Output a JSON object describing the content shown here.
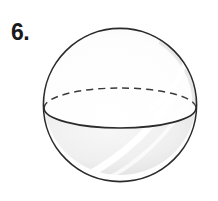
{
  "figure": {
    "label": "6.",
    "shape_name": "sphere",
    "background_color": "#ffffff",
    "outline_color": "#2b2b2b",
    "outline_width": 1.6,
    "equator_front_color": "#2b2b2b",
    "equator_back_color": "#3a3a3a",
    "equator_dash_pattern": "7 5",
    "upper_fill_color": "#fdfdfd",
    "lower_fill_color": "#eeeeee",
    "shade_edge_color": "#e2e2e2",
    "highlight_color": "#ffffff",
    "circle": {
      "cx": 120,
      "cy": 105,
      "r": 77
    },
    "equator_ellipse": {
      "cx": 120,
      "cy": 108,
      "rx": 76,
      "ry": 20
    }
  }
}
